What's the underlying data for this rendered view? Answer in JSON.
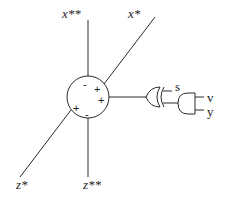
{
  "diagram": {
    "type": "neuron-logic-schematic",
    "axes": [
      {
        "id": "x_double_star",
        "label": "x**"
      },
      {
        "id": "x_star",
        "label": "x*"
      },
      {
        "id": "z_star",
        "label": "z*"
      },
      {
        "id": "z_double_star",
        "label": "z**"
      }
    ],
    "node": {
      "name": "summation-unit",
      "signs": [
        "-",
        "+",
        "+",
        "+",
        "-"
      ]
    },
    "gates": [
      {
        "type": "XOR",
        "inputs": [
          "s",
          "and-output"
        ],
        "output": "summation-unit"
      },
      {
        "type": "AND",
        "inputs": [
          "v",
          "y"
        ],
        "output": "xor-input"
      }
    ],
    "inputs": {
      "s": "s",
      "v": "v",
      "y": "y"
    }
  }
}
